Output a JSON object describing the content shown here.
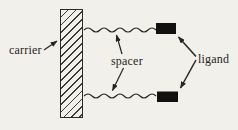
{
  "diagram": {
    "labels": {
      "carrier": "carrier",
      "spacer": "spacer",
      "ligand": "ligand"
    },
    "colors": {
      "paper": "#f2f0ea",
      "ink": "#242424",
      "ligand_block": "#111111"
    },
    "elements": {
      "carrier_bar": "hatched-vertical-bar",
      "spacer_wavy_lines": 2,
      "ligand_blocks": 2,
      "arrows": 5
    }
  }
}
